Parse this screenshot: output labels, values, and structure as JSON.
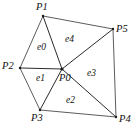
{
  "figure": {
    "kind": "triangular-mesh-diagram",
    "background_color": "#ffffff",
    "line_color": "#2b2b2b",
    "text_color": "#111111",
    "width": 138,
    "height": 131
  },
  "vertices": [
    {
      "id": "P0",
      "label": "P0",
      "x": 62,
      "y": 69,
      "label_x": 59,
      "label_y": 73
    },
    {
      "id": "P1",
      "label": "P1",
      "x": 43,
      "y": 16,
      "label_x": 36,
      "label_y": 2
    },
    {
      "id": "P2",
      "label": "P2",
      "x": 20,
      "y": 68,
      "label_x": 2,
      "label_y": 61
    },
    {
      "id": "P3",
      "label": "P3",
      "x": 40,
      "y": 110,
      "label_x": 31,
      "label_y": 113
    },
    {
      "id": "P4",
      "label": "P4",
      "x": 116,
      "y": 117,
      "label_x": 119,
      "label_y": 114
    },
    {
      "id": "P5",
      "label": "P5",
      "x": 113,
      "y": 29,
      "label_x": 116,
      "label_y": 24
    }
  ],
  "edges": [
    {
      "from": "P1",
      "to": "P2"
    },
    {
      "from": "P2",
      "to": "P3"
    },
    {
      "from": "P3",
      "to": "P4"
    },
    {
      "from": "P4",
      "to": "P5"
    },
    {
      "from": "P5",
      "to": "P1"
    },
    {
      "from": "P0",
      "to": "P1"
    },
    {
      "from": "P0",
      "to": "P2"
    },
    {
      "from": "P0",
      "to": "P3"
    },
    {
      "from": "P0",
      "to": "P4"
    },
    {
      "from": "P0",
      "to": "P5"
    }
  ],
  "elements": [
    {
      "id": "e0",
      "label": "e0",
      "vertices": [
        "P1",
        "P2",
        "P0"
      ],
      "label_x": 37,
      "label_y": 43
    },
    {
      "id": "e1",
      "label": "e1",
      "vertices": [
        "P2",
        "P3",
        "P0"
      ],
      "label_x": 36,
      "label_y": 74
    },
    {
      "id": "e2",
      "label": "e2",
      "vertices": [
        "P3",
        "P4",
        "P0"
      ],
      "label_x": 66,
      "label_y": 96
    },
    {
      "id": "e3",
      "label": "e3",
      "vertices": [
        "P4",
        "P5",
        "P0"
      ],
      "label_x": 87,
      "label_y": 69
    },
    {
      "id": "e4",
      "label": "e4",
      "vertices": [
        "P5",
        "P1",
        "P0"
      ],
      "label_x": 65,
      "label_y": 35
    }
  ]
}
